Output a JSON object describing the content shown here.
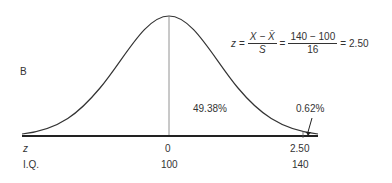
{
  "panel_label": "B",
  "formula": {
    "lhs": "z",
    "eq1": "=",
    "frac1_num": "X − X̄",
    "frac1_den": "S",
    "eq2": "=",
    "frac2_num": "140 − 100",
    "frac2_den": "16",
    "eq3": "=",
    "result": "2.50"
  },
  "areas": {
    "center_to_z": "49.38%",
    "tail": "0.62%"
  },
  "axis": {
    "z_label": "z",
    "iq_label": "I.Q.",
    "z_ticks": [
      "0",
      "2.50"
    ],
    "iq_ticks": [
      "100",
      "140"
    ]
  },
  "colors": {
    "ink": "#333333",
    "background": "#ffffff"
  }
}
